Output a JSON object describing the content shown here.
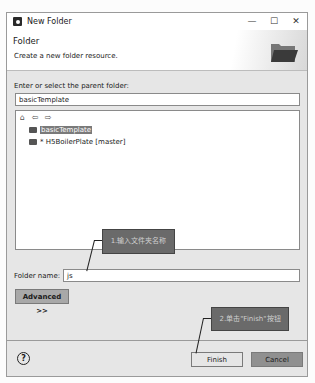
{
  "window": {
    "title": "New Folder",
    "minimize": "—",
    "maximize": "☐",
    "close": "✕"
  },
  "header": {
    "title": "Folder",
    "description": "Create a new folder resource."
  },
  "parent_folder": {
    "label": "Enter or select the parent folder:",
    "value": "basicTemplate"
  },
  "tree": {
    "toolbar": "⌂ ⇦ ⇨",
    "items": [
      {
        "label": "basicTemplate",
        "selected": true
      },
      {
        "label": "* H5BoilerPlate [master]",
        "selected": false
      }
    ]
  },
  "folder_name": {
    "label": "Folder name:",
    "value": "js"
  },
  "advanced_button": "Advanced >>",
  "help_icon": "?",
  "buttons": {
    "finish": "Finish",
    "cancel": "Cancel"
  },
  "annotations": {
    "step1": "1.输入文件夹名称",
    "step2": "2.单击\"Finish\"按钮"
  }
}
